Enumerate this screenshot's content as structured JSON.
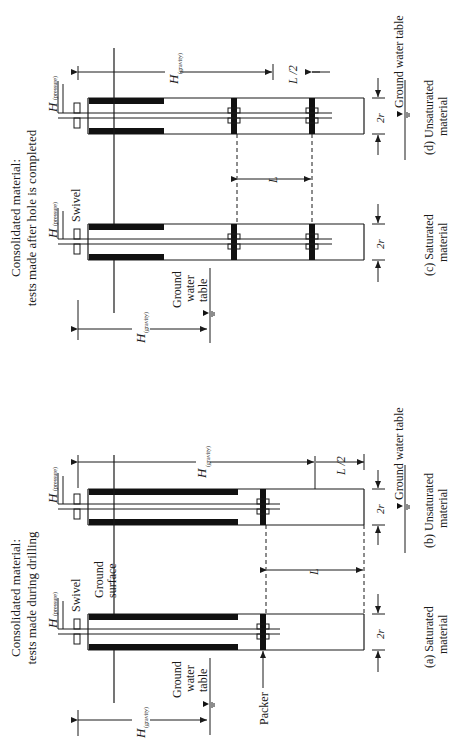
{
  "figure": {
    "orientation": "rotated 90deg counterclockwise",
    "groups": [
      {
        "title_line1": "Consolidated material:",
        "title_line2": "tests made during drilling",
        "panels": [
          {
            "id": "a",
            "caption_line1": "(a)  Saturated",
            "caption_line2": "material"
          },
          {
            "id": "b",
            "caption_line1": "(b)  Unsaturated",
            "caption_line2": "material"
          }
        ]
      },
      {
        "title_line1": "Consolidated material:",
        "title_line2": "tests made after hole is completed",
        "panels": [
          {
            "id": "c",
            "caption_line1": "(c)  Saturated",
            "caption_line2": "material"
          },
          {
            "id": "d",
            "caption_line1": "(d)  Unsaturated",
            "caption_line2": "material"
          }
        ]
      }
    ],
    "labels": {
      "swivel": "Swivel",
      "ground_surface_1": "Ground",
      "ground_surface_2": "surface",
      "gwt_1": "Ground",
      "gwt_2": "water",
      "gwt_3": "table",
      "gwt_inline": "Ground water table",
      "packer": "Packer",
      "h": "H",
      "sub_pressure": "(pressure)",
      "sub_gravity": "(gravity)",
      "L": "L",
      "L_half": "L /2",
      "two_r": "2r"
    },
    "colors": {
      "ink": "#1a1a1a",
      "background": "#ffffff"
    }
  }
}
